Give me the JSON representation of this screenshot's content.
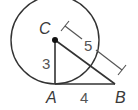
{
  "figure": {
    "type": "geometry",
    "points": {
      "C": {
        "label": "C",
        "x": 55,
        "y": 40
      },
      "A": {
        "label": "A",
        "x": 55,
        "y": 84
      },
      "B": {
        "label": "B",
        "x": 115,
        "y": 84
      }
    },
    "circle": {
      "center": "C",
      "radius_px": 44
    },
    "segments": [
      {
        "from": "C",
        "to": "A",
        "length_label": "3"
      },
      {
        "from": "A",
        "to": "B",
        "length_label": "4"
      },
      {
        "from": "C",
        "to": "B",
        "length_label": "5"
      }
    ],
    "labels": {
      "C": "C",
      "A": "A",
      "B": "B",
      "CA": "3",
      "AB": "4",
      "CB": "5"
    },
    "colors": {
      "stroke": "#333333",
      "text": "#3a3a3a",
      "dimension": "#555555"
    }
  }
}
